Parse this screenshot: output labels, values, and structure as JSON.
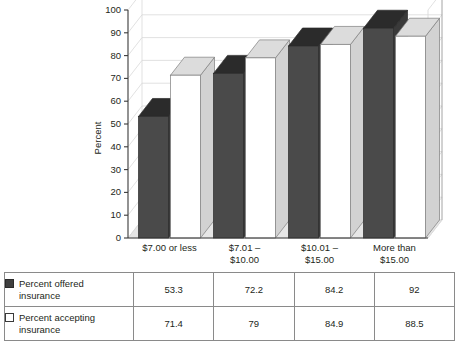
{
  "chart_data": {
    "type": "bar",
    "title": "",
    "subtitle": "",
    "xlabel": "",
    "ylabel": "Percent",
    "ylim": [
      0,
      100
    ],
    "ytick_step": 10,
    "yticks": [
      "0",
      "10",
      "20",
      "30",
      "40",
      "50",
      "60",
      "70",
      "80",
      "90",
      "100"
    ],
    "grid": true,
    "grid_orientation": "horizontal",
    "legend_position": "below-as-table",
    "three_d": true,
    "categories": [
      "$7.00 or less",
      "$7.01 –\n$10.00",
      "$10.01 –\n$15.00",
      "More than\n$15.00"
    ],
    "category_lines": [
      [
        "$7.00 or less",
        ""
      ],
      [
        "$7.01 –",
        "$10.00"
      ],
      [
        "$10.01 –",
        "$15.00"
      ],
      [
        "More than",
        "$15.00"
      ]
    ],
    "series": [
      {
        "name": "Percent offered insurance",
        "values": [
          53.3,
          72.2,
          84.2,
          92
        ],
        "value_labels": [
          "53.3",
          "72.2",
          "84.2",
          "92"
        ],
        "swatch": "filled",
        "color": "#4a4a4a"
      },
      {
        "name": "Percent accepting insurance",
        "values": [
          71.4,
          79,
          84.9,
          88.5
        ],
        "value_labels": [
          "71.4",
          "79",
          "84.9",
          "88.5"
        ],
        "swatch": "hollow",
        "color": "#ffffff"
      }
    ]
  },
  "colors": {
    "bar_offered_front": "#4a4a4a",
    "bar_offered_top": "#2b2b2b",
    "bar_offered_side": "#3a3a3a",
    "bar_accepting_front": "#ffffff",
    "bar_accepting_top": "#dcdcdc",
    "bar_accepting_side": "#d2d2d2",
    "grid_line": "#d9d9d9",
    "axis_line": "#3a3a3a",
    "floor": "#e6e6e6",
    "table_border": "#8a8a8a",
    "text": "#231f20",
    "background": "#ffffff"
  },
  "table": {
    "rows": [
      {
        "label_line1": "Percent offered",
        "label_line2": "insurance",
        "swatch": "filled",
        "values": [
          "53.3",
          "72.2",
          "84.2",
          "92"
        ]
      },
      {
        "label_line1": "Percent accepting",
        "label_line2": "insurance",
        "swatch": "hollow",
        "values": [
          "71.4",
          "79",
          "84.9",
          "88.5"
        ]
      }
    ]
  }
}
